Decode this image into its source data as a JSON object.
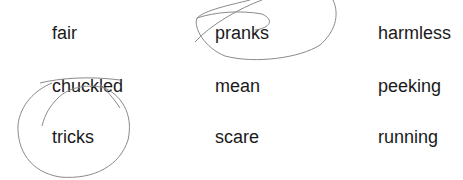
{
  "words": [
    [
      "fair",
      "pranks",
      "harmless"
    ],
    [
      "chuckled",
      "mean",
      "peeking"
    ],
    [
      "tricks",
      "scare",
      "running"
    ]
  ],
  "annotations": {
    "circled": [
      "pranks",
      "tricks"
    ],
    "stroke_color": "#8a8a8a"
  }
}
